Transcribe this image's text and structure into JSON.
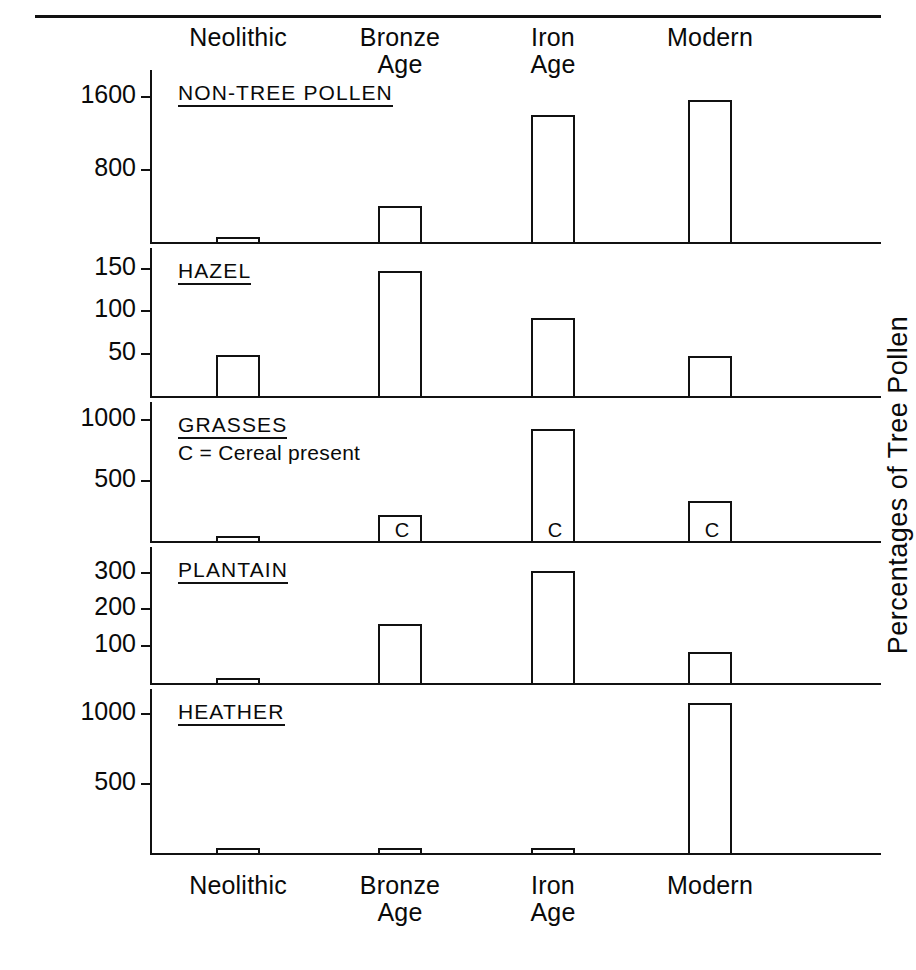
{
  "figure": {
    "running_head": "",
    "right_axis_title": "Percentages of Tree Pollen",
    "top_categories": [
      "Neolithic",
      "Bronze\nAge",
      "Iron\nAge",
      "Modern"
    ],
    "bottom_categories": [
      "Neolithic",
      "Bronze\nAge",
      "Iron\nAge",
      "Modern"
    ]
  },
  "chart_data": {
    "type": "bar",
    "title": "",
    "xlabel": "",
    "ylabel": "Percentages of Tree Pollen",
    "grid": false,
    "legend": "none",
    "categories": [
      "Neolithic",
      "Bronze Age",
      "Iron Age",
      "Modern"
    ],
    "panels": [
      {
        "name": "NON-TREE POLLEN",
        "note": "",
        "yticks": [
          800,
          1600
        ],
        "ytick_labels": [
          "800",
          "1600"
        ],
        "ylim": [
          0,
          1900
        ],
        "values": [
          40,
          400,
          1400,
          1570
        ],
        "cereal": [
          false,
          false,
          false,
          false
        ]
      },
      {
        "name": "HAZEL",
        "note": "",
        "yticks": [
          50,
          100,
          150
        ],
        "ytick_labels": [
          "50",
          "100",
          "150"
        ],
        "ylim": [
          0,
          175
        ],
        "values": [
          49,
          148,
          92,
          47
        ],
        "cereal": [
          false,
          false,
          false,
          false
        ]
      },
      {
        "name": "GRASSES",
        "note": "C = Cereal present",
        "yticks": [
          500,
          1000
        ],
        "ytick_labels": [
          "500",
          "1000"
        ],
        "ylim": [
          0,
          1150
        ],
        "values": [
          25,
          110,
          930,
          330
        ],
        "cereal": [
          false,
          true,
          true,
          true
        ]
      },
      {
        "name": "PLANTAIN",
        "note": "",
        "yticks": [
          100,
          200,
          300
        ],
        "ytick_labels": [
          "100",
          "200",
          "300"
        ],
        "ylim": [
          0,
          370
        ],
        "values": [
          12,
          160,
          305,
          85
        ],
        "cereal": [
          false,
          false,
          false,
          false
        ]
      },
      {
        "name": "HEATHER",
        "note": "",
        "yticks": [
          500,
          1000
        ],
        "ytick_labels": [
          "500",
          "1000"
        ],
        "ylim": [
          0,
          1180
        ],
        "values": [
          8,
          10,
          30,
          1080
        ],
        "cereal": [
          false,
          false,
          false,
          false
        ]
      }
    ],
    "cereal_marker": "C"
  },
  "layout": {
    "bar_centers": [
      238,
      400,
      553,
      710
    ],
    "bar_width": 44,
    "axis_x": 150,
    "axis_right": 881,
    "panel_bounds": [
      {
        "top": 70,
        "base": 242
      },
      {
        "top": 248,
        "base": 396
      },
      {
        "top": 402,
        "base": 541
      },
      {
        "top": 547,
        "base": 683
      },
      {
        "top": 689,
        "base": 853
      }
    ],
    "ink": "#111111"
  }
}
